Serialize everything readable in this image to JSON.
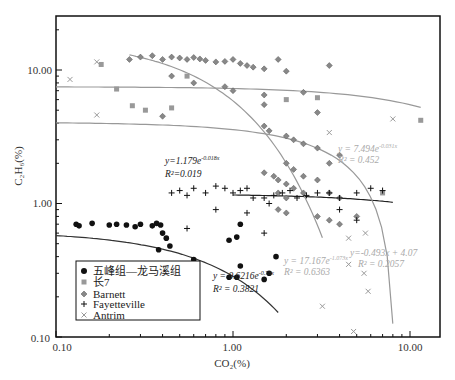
{
  "chart_data": {
    "type": "scatter",
    "title": "",
    "xlabel": "CO2(%)",
    "ylabel": "C2H6(%)",
    "xscale": "log",
    "yscale": "log",
    "xlim": [
      0.1,
      15
    ],
    "ylim": [
      0.1,
      25
    ],
    "x_ticks": [
      "0.10",
      "1.00",
      "10.00"
    ],
    "y_ticks": [
      "0.10",
      "1.00",
      "10.00"
    ],
    "grid": false,
    "legend_position": "lower-left",
    "legend": [
      {
        "name": "五峰组—龙马溪组",
        "marker": "circle",
        "color": "#111111"
      },
      {
        "name": "长7",
        "marker": "square",
        "color": "#999999"
      },
      {
        "name": "Barnett",
        "marker": "diamond",
        "color": "#777777"
      },
      {
        "name": "Fayetteville",
        "marker": "plus",
        "color": "#111111"
      },
      {
        "name": "Antrim",
        "marker": "x",
        "color": "#999999"
      }
    ],
    "series": [
      {
        "name": "五峰组—龙马溪组",
        "points": [
          [
            0.13,
            0.7
          ],
          [
            0.135,
            0.68
          ],
          [
            0.16,
            0.71
          ],
          [
            0.2,
            0.69
          ],
          [
            0.22,
            0.7
          ],
          [
            0.25,
            0.69
          ],
          [
            0.28,
            0.67
          ],
          [
            0.3,
            0.7
          ],
          [
            0.35,
            0.68
          ],
          [
            0.37,
            0.71
          ],
          [
            0.39,
            0.69
          ],
          [
            0.4,
            0.6
          ],
          [
            0.42,
            0.55
          ],
          [
            0.38,
            0.45
          ],
          [
            0.44,
            0.48
          ],
          [
            0.6,
            0.38
          ],
          [
            0.95,
            0.53
          ],
          [
            1.05,
            0.56
          ],
          [
            1.1,
            0.7
          ],
          [
            0.95,
            0.28
          ],
          [
            1.05,
            0.28
          ],
          [
            1.1,
            0.34
          ],
          [
            1.5,
            0.27
          ],
          [
            1.6,
            0.3
          ],
          [
            1.75,
            0.4
          ]
        ]
      },
      {
        "name": "长7",
        "points": [
          [
            0.18,
            11.0
          ],
          [
            0.22,
            7.2
          ],
          [
            0.27,
            5.4
          ],
          [
            0.32,
            5.0
          ],
          [
            0.45,
            5.2
          ],
          [
            0.55,
            9.0
          ],
          [
            2.0,
            6.0
          ],
          [
            3.0,
            6.2
          ],
          [
            11.5,
            4.2
          ],
          [
            7.0,
            1.2
          ]
        ]
      },
      {
        "name": "Barnett",
        "points": [
          [
            0.26,
            12.0
          ],
          [
            0.3,
            12.5
          ],
          [
            0.35,
            12.8
          ],
          [
            0.4,
            12.0
          ],
          [
            0.45,
            12.5
          ],
          [
            0.5,
            12.3
          ],
          [
            0.55,
            12.0
          ],
          [
            0.6,
            12.4
          ],
          [
            0.65,
            12.1
          ],
          [
            0.7,
            11.8
          ],
          [
            0.8,
            11.5
          ],
          [
            0.9,
            11.6
          ],
          [
            1.0,
            12.0
          ],
          [
            1.1,
            11.2
          ],
          [
            1.2,
            10.8
          ],
          [
            1.3,
            10.5
          ],
          [
            1.5,
            10.2
          ],
          [
            1.8,
            12.0
          ],
          [
            2.0,
            9.8
          ],
          [
            3.5,
            10.8
          ],
          [
            0.45,
            9.0
          ],
          [
            0.6,
            8.0
          ],
          [
            0.9,
            7.5
          ],
          [
            1.0,
            7.0
          ],
          [
            1.5,
            6.5
          ],
          [
            1.5,
            5.5
          ],
          [
            2.5,
            6.8
          ],
          [
            3.0,
            4.8
          ],
          [
            0.4,
            4.5
          ],
          [
            1.5,
            3.8
          ],
          [
            1.6,
            3.5
          ],
          [
            2.0,
            3.2
          ],
          [
            2.2,
            3.0
          ],
          [
            2.5,
            2.8
          ],
          [
            3.0,
            2.6
          ],
          [
            3.5,
            2.0
          ],
          [
            4.0,
            2.3
          ],
          [
            2.0,
            2.0
          ],
          [
            2.2,
            1.8
          ],
          [
            2.5,
            1.6
          ],
          [
            3.0,
            1.5
          ],
          [
            1.5,
            1.7
          ],
          [
            1.7,
            1.6
          ],
          [
            1.8,
            1.5
          ],
          [
            2.0,
            1.4
          ],
          [
            2.2,
            1.3
          ],
          [
            2.5,
            1.2
          ],
          [
            1.8,
            1.2
          ],
          [
            2.0,
            1.1
          ],
          [
            3.5,
            1.2
          ],
          [
            4.0,
            1.1
          ],
          [
            1.8,
            0.9
          ],
          [
            2.0,
            0.85
          ],
          [
            3.0,
            0.8
          ],
          [
            3.5,
            0.75
          ],
          [
            4.0,
            0.7
          ],
          [
            5.0,
            0.8
          ]
        ]
      },
      {
        "name": "Fayetteville",
        "points": [
          [
            0.45,
            1.2
          ],
          [
            0.5,
            1.25
          ],
          [
            0.55,
            1.15
          ],
          [
            0.6,
            1.3
          ],
          [
            0.7,
            1.2
          ],
          [
            0.8,
            1.35
          ],
          [
            0.9,
            1.3
          ],
          [
            1.0,
            1.2
          ],
          [
            1.1,
            1.25
          ],
          [
            1.2,
            1.3
          ],
          [
            1.3,
            1.1
          ],
          [
            1.5,
            1.1
          ],
          [
            1.6,
            1.0
          ],
          [
            1.7,
            1.15
          ],
          [
            1.9,
            1.2
          ],
          [
            2.1,
            1.25
          ],
          [
            2.3,
            1.1
          ],
          [
            2.6,
            1.15
          ],
          [
            3.0,
            1.2
          ],
          [
            3.5,
            1.2
          ],
          [
            4.0,
            1.1
          ],
          [
            5.0,
            1.2
          ],
          [
            6.0,
            1.3
          ],
          [
            7.0,
            1.25
          ],
          [
            0.55,
            0.65
          ],
          [
            0.8,
            0.9
          ],
          [
            1.2,
            0.85
          ],
          [
            1.5,
            0.6
          ],
          [
            5.0,
            0.75
          ],
          [
            4.0,
            0.9
          ]
        ]
      },
      {
        "name": "Antrim",
        "points": [
          [
            0.12,
            8.5
          ],
          [
            0.17,
            11.5
          ],
          [
            0.17,
            4.6
          ],
          [
            3.5,
            3.4
          ],
          [
            3.2,
            0.17
          ],
          [
            4.5,
            0.35
          ],
          [
            4.5,
            0.55
          ],
          [
            5.5,
            0.3
          ],
          [
            5.6,
            0.6
          ],
          [
            5.8,
            0.22
          ],
          [
            4.8,
            0.11
          ],
          [
            8.0,
            4.3
          ]
        ]
      }
    ],
    "fits": [
      {
        "series": "五峰组—龙马溪组",
        "equation": "y = 0.6216e^-0.78x",
        "r2": "R² = 0.3821"
      },
      {
        "series": "Fayetteville",
        "equation": "y=1.179e^-0.018x",
        "r2": "R²=0.019"
      },
      {
        "series": "长7",
        "equation": "y = 7.494e^-0.031x",
        "r2": "R² = 0.452"
      },
      {
        "series": "Barnett",
        "equation": "y = 17.167e^-1.073x",
        "r2": "R² = 0.6363"
      },
      {
        "series": "Antrim",
        "equation": "y=-0.493x + 4.07",
        "r2": "R² = 0.2057"
      }
    ]
  },
  "labels": {
    "x_axis": "CO₂(%)",
    "y_axis": "C₂H₆(%)",
    "xticks": [
      "0.10",
      "1.00",
      "10.00"
    ],
    "yticks": [
      "0.10",
      "1.00",
      "10.00"
    ],
    "legend": [
      "五峰组—龙马溪组",
      "长7",
      "Barnett",
      "Fayetteville",
      "Antrim"
    ],
    "fit_fay_eq": "y=1.179e",
    "fit_fay_exp": "-0.018x",
    "fit_fay_r2": "R²=0.019",
    "fit_wf_eq": "y = 0.6216e",
    "fit_wf_exp": "-0.78x",
    "fit_wf_r2": "R² = 0.3821",
    "fit_c7_eq": "y = 7.494e",
    "fit_c7_exp": "-0.031x",
    "fit_c7_r2": "R² = 0.452",
    "fit_bar_eq": "y = 17.167e",
    "fit_bar_exp": "-1.073x",
    "fit_bar_r2": "R² = 0.6363",
    "fit_ant_eq": "y=-0.493x + 4.07",
    "fit_ant_r2": "R² = 0.2057"
  }
}
